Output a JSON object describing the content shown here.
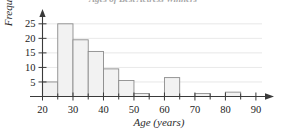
{
  "chart_data": {
    "type": "bar",
    "title": "Ages of Best Actress Winners",
    "xlabel": "Age (years)",
    "ylabel": "Frequency",
    "xlim": [
      15,
      92
    ],
    "ylim": [
      0,
      27
    ],
    "grid": true,
    "legend": "none",
    "bin_width": 5,
    "x_tick_labels": [
      "20",
      "30",
      "40",
      "50",
      "60",
      "70",
      "80",
      "90"
    ],
    "x_ticks": [
      20,
      30,
      40,
      50,
      60,
      70,
      80,
      90
    ],
    "y_tick_labels": [
      "5",
      "10",
      "15",
      "20",
      "25"
    ],
    "y_ticks": [
      5,
      10,
      15,
      20,
      25
    ],
    "bin_edges": [
      20,
      25,
      30,
      35,
      40,
      45,
      50,
      55,
      60,
      65,
      70,
      75,
      80,
      85
    ],
    "categories": [
      "20-25",
      "25-30",
      "30-35",
      "35-40",
      "40-45",
      "45-50",
      "50-55",
      "55-60",
      "60-65",
      "65-70",
      "70-75",
      "75-80",
      "80-85"
    ],
    "values": [
      5,
      25,
      19.5,
      15.5,
      9.5,
      5.5,
      1,
      0,
      6.5,
      0,
      1,
      0,
      1.5
    ],
    "bar_fill_color": "#f2f2f2",
    "bar_edge_color": "#8c8c8c",
    "axis_color": "#3a3a3a",
    "grid_color": "#d8d8d8"
  }
}
